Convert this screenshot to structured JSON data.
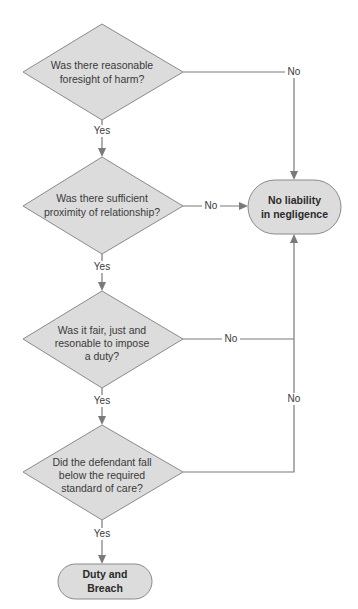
{
  "diagram": {
    "type": "flowchart",
    "colors": {
      "node_fill": "#dcdcdc",
      "node_stroke": "#8a8a8a",
      "edge": "#7a7a7a",
      "text": "#3a3a3a",
      "background": "#ffffff"
    },
    "decisions": [
      {
        "id": "d1",
        "lines": [
          "Was there reasonable",
          "foresight of harm?"
        ]
      },
      {
        "id": "d2",
        "lines": [
          "Was there sufficient",
          "proximity of relationship?"
        ]
      },
      {
        "id": "d3",
        "lines": [
          "Was it fair, just and",
          "resonable to impose",
          "a duty?"
        ]
      },
      {
        "id": "d4",
        "lines": [
          "Did the defendant fall",
          "below the required",
          "standard of care?"
        ]
      }
    ],
    "terminals": {
      "no_liability": {
        "lines": [
          "No liability",
          "in negligence"
        ]
      },
      "duty_breach": {
        "lines": [
          "Duty and",
          "Breach"
        ]
      }
    },
    "edges": [
      {
        "from": "d1",
        "to": "d2",
        "label": "Yes"
      },
      {
        "from": "d1",
        "to": "no_liability",
        "label": "No"
      },
      {
        "from": "d2",
        "to": "d3",
        "label": "Yes"
      },
      {
        "from": "d2",
        "to": "no_liability",
        "label": "No"
      },
      {
        "from": "d3",
        "to": "d4",
        "label": "Yes"
      },
      {
        "from": "d3",
        "to": "no_liability",
        "label": "No"
      },
      {
        "from": "d4",
        "to": "duty_breach",
        "label": "Yes"
      },
      {
        "from": "d4",
        "to": "no_liability",
        "label": "No"
      }
    ]
  }
}
